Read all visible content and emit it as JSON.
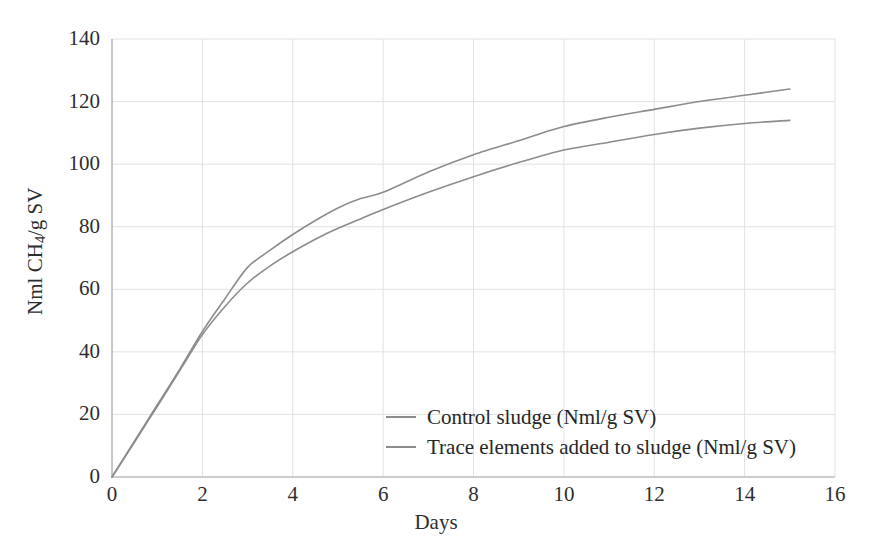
{
  "chart_data": {
    "type": "line",
    "title": "",
    "xlabel": "Days",
    "ylabel": "Nml CH4/g SV",
    "ylabel_prefix": "Nml CH",
    "ylabel_sub": "4",
    "ylabel_suffix": "/g SV",
    "xlim": [
      0,
      16
    ],
    "ylim": [
      0,
      140
    ],
    "xticks": [
      0,
      2,
      4,
      6,
      8,
      10,
      12,
      14,
      16
    ],
    "yticks": [
      0,
      20,
      40,
      60,
      80,
      100,
      120,
      140
    ],
    "grid": true,
    "legend_position": "inside-lower-center",
    "x": [
      0,
      0.5,
      1,
      1.5,
      2,
      2.5,
      3,
      3.5,
      4,
      4.5,
      5,
      5.5,
      6,
      7,
      8,
      9,
      10,
      11,
      12,
      13,
      14,
      15
    ],
    "series": [
      {
        "name": "Trace elements added to sludge (Nml/g SV)",
        "color": "#8c8c8c",
        "values": [
          0,
          11.5,
          23.0,
          34.5,
          46.5,
          57.0,
          67.0,
          72.5,
          77.5,
          82.0,
          86.0,
          89.0,
          91.0,
          97.5,
          103.0,
          107.5,
          112.0,
          115.0,
          117.5,
          120.0,
          122.0,
          124.0
        ]
      },
      {
        "name": "Control sludge (Nml/g SV)",
        "color": "#8c8c8c",
        "values": [
          0,
          11.2,
          22.5,
          34.0,
          45.5,
          54.5,
          62.0,
          67.5,
          72.0,
          76.0,
          79.5,
          82.5,
          85.5,
          91.0,
          96.0,
          100.5,
          104.5,
          107.0,
          109.5,
          111.5,
          113.0,
          114.0
        ]
      }
    ]
  },
  "legend": {
    "items": [
      {
        "label": "Control sludge (Nml/g SV)",
        "color": "#8c8c8c"
      },
      {
        "label": "Trace elements added to sludge (Nml/g SV)",
        "color": "#8c8c8c"
      }
    ]
  },
  "axes": {
    "x_title": "Days",
    "x_tick_labels": [
      "0",
      "2",
      "4",
      "6",
      "8",
      "10",
      "12",
      "14",
      "16"
    ],
    "y_tick_labels": [
      "0",
      "20",
      "40",
      "60",
      "80",
      "100",
      "120",
      "140"
    ]
  },
  "colors": {
    "series_line": "#8c8c8c",
    "grid": "#e2e2e2",
    "axis": "#aaaaaa",
    "text": "#2e2e2e",
    "background": "#ffffff"
  }
}
